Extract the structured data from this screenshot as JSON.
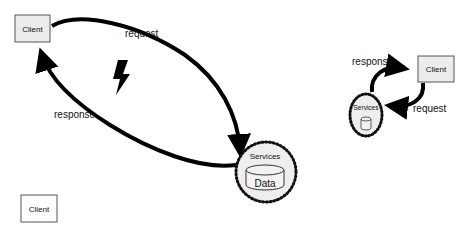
{
  "left_diagram": {
    "client_label": "Client",
    "request_label": "request",
    "response_label": "response",
    "services_label": "Services",
    "data_label": "Data",
    "lightning_icon": "lightning-bolt"
  },
  "right_diagram": {
    "client_label": "Client",
    "request_label": "request",
    "response_label": "response",
    "services_label": "Services",
    "data_icon": "database-cylinder"
  },
  "bottom_left": {
    "client_label": "Client"
  },
  "colors": {
    "client_box_fill": "#ececec",
    "client_box_stroke": "#555555",
    "services_fill": "#eeeeee",
    "arrow": "#000000"
  }
}
